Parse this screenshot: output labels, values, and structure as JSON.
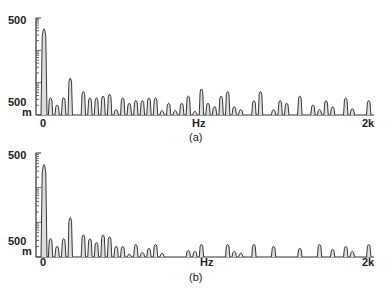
{
  "chart_data": [
    {
      "type": "bar",
      "panel": "(a)",
      "title": "",
      "xlabel": "Hz",
      "ylabel": "",
      "x_ticks": [
        "0",
        "2k"
      ],
      "y_ticks": [
        "500",
        "500 m"
      ],
      "y_scale": "log",
      "xlim": [
        0,
        2000
      ],
      "caption": "(a)",
      "grid": false,
      "x": [
        0,
        40,
        80,
        120,
        160,
        240,
        280,
        320,
        360,
        400,
        440,
        480,
        520,
        560,
        600,
        640,
        680,
        720,
        760,
        800,
        840,
        880,
        920,
        960,
        1000,
        1040,
        1080,
        1120,
        1160,
        1200,
        1280,
        1320,
        1400,
        1440,
        1480,
        1560,
        1640,
        1680,
        1720,
        1760,
        1840,
        1880,
        1980
      ],
      "values": [
        0.95,
        0.18,
        0.1,
        0.18,
        0.4,
        0.25,
        0.18,
        0.18,
        0.2,
        0.22,
        0.05,
        0.18,
        0.12,
        0.15,
        0.15,
        0.18,
        0.18,
        0.04,
        0.12,
        0.04,
        0.12,
        0.2,
        0.03,
        0.28,
        0.12,
        0.08,
        0.2,
        0.25,
        0.08,
        0.05,
        0.15,
        0.25,
        0.05,
        0.15,
        0.12,
        0.2,
        0.1,
        0.05,
        0.15,
        0.08,
        0.18,
        0.06,
        0.15
      ]
    },
    {
      "type": "bar",
      "panel": "(b)",
      "title": "",
      "xlabel": "Hz",
      "ylabel": "",
      "x_ticks": [
        "0",
        "2k"
      ],
      "y_ticks": [
        "500",
        "500 m"
      ],
      "y_scale": "log",
      "xlim": [
        0,
        2000
      ],
      "caption": "(b)",
      "grid": false,
      "x": [
        0,
        40,
        80,
        120,
        160,
        240,
        280,
        320,
        360,
        400,
        440,
        480,
        520,
        560,
        600,
        640,
        680,
        720,
        880,
        920,
        960,
        1120,
        1160,
        1200,
        1280,
        1400,
        1560,
        1680,
        1760,
        1840,
        1880,
        1980
      ],
      "values": [
        0.95,
        0.18,
        0.1,
        0.18,
        0.4,
        0.22,
        0.18,
        0.14,
        0.22,
        0.2,
        0.1,
        0.1,
        0.02,
        0.12,
        0.04,
        0.08,
        0.12,
        0.03,
        0.06,
        0.05,
        0.12,
        0.12,
        0.05,
        0.03,
        0.12,
        0.1,
        0.08,
        0.12,
        0.07,
        0.1,
        0.05,
        0.12
      ]
    }
  ],
  "panels": [
    {
      "caption": "(a)",
      "y_top": "500",
      "y_bottom": "500",
      "y_unit": "m",
      "x_start": "0",
      "x_unit": "Hz",
      "x_end": "2k"
    },
    {
      "caption": "(b)",
      "y_top": "500",
      "y_bottom": "500",
      "y_unit": "m",
      "x_start": "0",
      "x_unit": "Hz",
      "x_end": "2k"
    }
  ]
}
